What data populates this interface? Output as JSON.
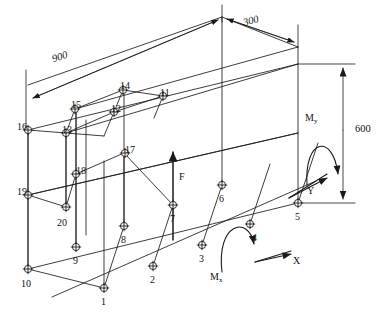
{
  "diagram": {
    "type": "engineering-isometric-wireframe",
    "background_color": "#ffffff",
    "line_color": "#1a1a1a"
  },
  "dimensions": [
    {
      "id": "len-900",
      "label": "900",
      "orientation": "slanted-top-left"
    },
    {
      "id": "len-300",
      "label": "300",
      "orientation": "slanted-top-right"
    },
    {
      "id": "height-600",
      "label": "600",
      "orientation": "vertical-right"
    }
  ],
  "loads": [
    {
      "id": "force-f",
      "label": "F",
      "type": "force",
      "direction": "up"
    },
    {
      "id": "moment-mx",
      "label": "M",
      "sub": "x",
      "type": "moment",
      "sense": "about-x"
    },
    {
      "id": "moment-my",
      "label": "M",
      "sub": "y",
      "type": "moment",
      "sense": "about-y"
    }
  ],
  "axes": [
    {
      "id": "axis-x",
      "label": "X",
      "direction": "right"
    },
    {
      "id": "axis-y",
      "label": "Y",
      "direction": "up-right"
    }
  ],
  "nodes": [
    {
      "n": "1",
      "x": 104,
      "y": 288,
      "lx": 101,
      "ly": 297
    },
    {
      "n": "2",
      "x": 153,
      "y": 266,
      "lx": 150,
      "ly": 275
    },
    {
      "n": "3",
      "x": 202,
      "y": 245,
      "lx": 199,
      "ly": 254
    },
    {
      "n": "4",
      "x": 250,
      "y": 224,
      "lx": 252,
      "ly": 233
    },
    {
      "n": "5",
      "x": 298,
      "y": 203,
      "lx": 295,
      "ly": 212
    },
    {
      "n": "6",
      "x": 222,
      "y": 185,
      "lx": 219,
      "ly": 194
    },
    {
      "n": "7",
      "x": 173,
      "y": 205,
      "lx": 170,
      "ly": 214
    },
    {
      "n": "8",
      "x": 124,
      "y": 226,
      "lx": 121,
      "ly": 235
    },
    {
      "n": "9",
      "x": 76,
      "y": 247,
      "lx": 73,
      "ly": 256
    },
    {
      "n": "10",
      "x": 28,
      "y": 269,
      "lx": 21,
      "ly": 279
    },
    {
      "n": "11",
      "x": 163,
      "y": 96,
      "lx": 160,
      "ly": 88
    },
    {
      "n": "12",
      "x": 114,
      "y": 112,
      "lx": 111,
      "ly": 104
    },
    {
      "n": "13",
      "x": 66,
      "y": 133,
      "lx": 62,
      "ly": 125
    },
    {
      "n": "14",
      "x": 123,
      "y": 90,
      "lx": 120,
      "ly": 81
    },
    {
      "n": "15",
      "x": 75,
      "y": 109,
      "lx": 71,
      "ly": 100
    },
    {
      "n": "16",
      "x": 28,
      "y": 130,
      "lx": 17,
      "ly": 122
    },
    {
      "n": "17",
      "x": 125,
      "y": 153,
      "lx": 125,
      "ly": 145
    },
    {
      "n": "18",
      "x": 76,
      "y": 174,
      "lx": 76,
      "ly": 166
    },
    {
      "n": "19",
      "x": 28,
      "y": 195,
      "lx": 17,
      "ly": 187
    },
    {
      "n": "20",
      "x": 66,
      "y": 207,
      "lx": 57,
      "ly": 218
    }
  ]
}
